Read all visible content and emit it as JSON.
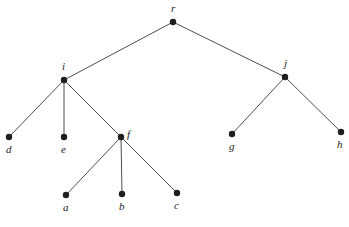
{
  "diagram": {
    "type": "rooted-tree",
    "nodes": [
      {
        "id": "r",
        "label": "r",
        "x": 173,
        "y": 22,
        "lx": 171,
        "ly": 12
      },
      {
        "id": "i",
        "label": "i",
        "x": 64,
        "y": 80,
        "lx": 62,
        "ly": 70
      },
      {
        "id": "j",
        "label": "j",
        "x": 285,
        "y": 77,
        "lx": 284,
        "ly": 67
      },
      {
        "id": "d",
        "label": "d",
        "x": 9,
        "y": 137,
        "lx": 6,
        "ly": 153
      },
      {
        "id": "e",
        "label": "e",
        "x": 64,
        "y": 137,
        "lx": 61,
        "ly": 153
      },
      {
        "id": "f",
        "label": "f",
        "x": 121,
        "y": 137,
        "lx": 127,
        "ly": 138
      },
      {
        "id": "g",
        "label": "g",
        "x": 232,
        "y": 134,
        "lx": 229,
        "ly": 150
      },
      {
        "id": "h",
        "label": "h",
        "x": 341,
        "y": 132,
        "lx": 337,
        "ly": 148
      },
      {
        "id": "a",
        "label": "a",
        "x": 66,
        "y": 195,
        "lx": 63,
        "ly": 211
      },
      {
        "id": "b",
        "label": "b",
        "x": 122,
        "y": 194,
        "lx": 119,
        "ly": 210
      },
      {
        "id": "c",
        "label": "c",
        "x": 177,
        "y": 193,
        "lx": 174,
        "ly": 209
      }
    ],
    "edges": [
      [
        "r",
        "i"
      ],
      [
        "r",
        "j"
      ],
      [
        "i",
        "d"
      ],
      [
        "i",
        "e"
      ],
      [
        "i",
        "f"
      ],
      [
        "j",
        "g"
      ],
      [
        "j",
        "h"
      ],
      [
        "f",
        "a"
      ],
      [
        "f",
        "b"
      ],
      [
        "f",
        "c"
      ]
    ]
  }
}
